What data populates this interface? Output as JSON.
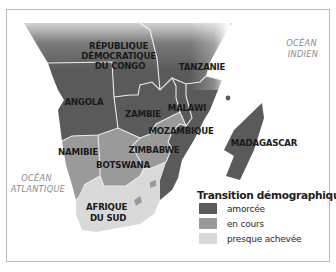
{
  "map": {
    "title": "Transition démographique en Afrique australe",
    "colors": {
      "amorcee": "#5a5a5a",
      "en_cours": "#9a9a9a",
      "presque_achevee": "#d9d9d9",
      "border": "#e8e8e8",
      "frame": "#bdbdbd"
    },
    "countries": [
      {
        "name_lines": [
          "RÉPUBLIQUE",
          "DÉMOCRATIQUE",
          "DU CONGO"
        ],
        "category": "amorcée"
      },
      {
        "name_lines": [
          "TANZANIE"
        ],
        "category": "amorcée"
      },
      {
        "name_lines": [
          "ANGOLA"
        ],
        "category": "amorcée"
      },
      {
        "name_lines": [
          "ZAMBIE"
        ],
        "category": "amorcée"
      },
      {
        "name_lines": [
          "MALAWI"
        ],
        "category": "amorcée"
      },
      {
        "name_lines": [
          "MOZAMBIQUE"
        ],
        "category": "amorcée"
      },
      {
        "name_lines": [
          "MADAGASCAR"
        ],
        "category": "amorcée"
      },
      {
        "name_lines": [
          "NAMIBIE"
        ],
        "category": "en cours"
      },
      {
        "name_lines": [
          "BOTSWANA"
        ],
        "category": "en cours"
      },
      {
        "name_lines": [
          "ZIMBABWE"
        ],
        "category": "en cours"
      },
      {
        "name_lines": [
          "AFRIQUE",
          "DU SUD"
        ],
        "category": "presque achevée"
      }
    ],
    "oceans": [
      {
        "name_lines": [
          "OCÉAN",
          "INDIEN"
        ]
      },
      {
        "name_lines": [
          "OCÉAN",
          "ATLANTIQUE"
        ]
      }
    ]
  },
  "legend": {
    "title": "Transition démographique",
    "items": [
      {
        "label": "amorcée",
        "color": "#5a5a5a"
      },
      {
        "label": "en cours",
        "color": "#9a9a9a"
      },
      {
        "label": "presque achevée",
        "color": "#d9d9d9"
      }
    ]
  }
}
